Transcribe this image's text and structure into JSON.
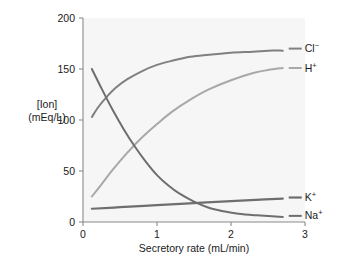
{
  "chart_data": {
    "type": "line",
    "title": "",
    "xlabel": "Secretory rate (mL/min)",
    "ylabel_line1": "[Ion]",
    "ylabel_line2": "(mEq/L)",
    "xlim": [
      0,
      3
    ],
    "ylim": [
      0,
      200
    ],
    "xticks": [
      "0",
      "1",
      "2",
      "3"
    ],
    "xtick_values": [
      0,
      1,
      2,
      3
    ],
    "yticks": [
      "0",
      "50",
      "100",
      "150",
      "200"
    ],
    "ytick_values": [
      0,
      50,
      100,
      150,
      200
    ],
    "grid": false,
    "legend_position": "right-inline-end-of-curve",
    "series": [
      {
        "name": "Cl-",
        "label_main": "Cl",
        "label_sup": "−",
        "color": "#808080",
        "stroke_width": 2.0,
        "label_x": 2.78,
        "label_y": 170,
        "x": [
          0.12,
          0.2,
          0.3,
          0.45,
          0.6,
          0.8,
          1.0,
          1.2,
          1.45,
          1.7,
          2.0,
          2.3,
          2.5,
          2.7
        ],
        "y": [
          103,
          112,
          121,
          132,
          140,
          148,
          154,
          158,
          162,
          164,
          166,
          167,
          168,
          168
        ]
      },
      {
        "name": "H+",
        "label_main": "H",
        "label_sup": "+",
        "color": "#a8a8a8",
        "stroke_width": 2.0,
        "label_x": 2.78,
        "label_y": 151,
        "x": [
          0.12,
          0.25,
          0.4,
          0.6,
          0.8,
          1.0,
          1.2,
          1.45,
          1.7,
          2.0,
          2.3,
          2.5,
          2.7
        ],
        "y": [
          25,
          37,
          51,
          68,
          83,
          96,
          108,
          120,
          130,
          139,
          146,
          149,
          151
        ]
      },
      {
        "name": "K+",
        "label_main": "K",
        "label_sup": "+",
        "color": "#6e6e6e",
        "stroke_width": 2.2,
        "label_x": 2.78,
        "label_y": 24,
        "x": [
          0.12,
          0.5,
          1.0,
          1.5,
          2.0,
          2.4,
          2.7
        ],
        "y": [
          13,
          14.5,
          16.5,
          18.5,
          20.5,
          22,
          23
        ]
      },
      {
        "name": "Na+",
        "label_main": "Na",
        "label_sup": "+",
        "color": "#6e6e6e",
        "stroke_width": 2.0,
        "label_x": 2.78,
        "label_y": 6,
        "x": [
          0.12,
          0.25,
          0.4,
          0.55,
          0.7,
          0.85,
          1.0,
          1.15,
          1.3,
          1.5,
          1.7,
          1.9,
          2.1,
          2.35,
          2.7
        ],
        "y": [
          150,
          131,
          110,
          91,
          74,
          59,
          46,
          36,
          28,
          20,
          14,
          10.5,
          8,
          6.5,
          5
        ]
      }
    ]
  },
  "colors": {
    "plot_background": "#f6f6f6",
    "axis": "#8a8a8a",
    "text": "#1a1a1a",
    "page_background": "#ffffff"
  }
}
